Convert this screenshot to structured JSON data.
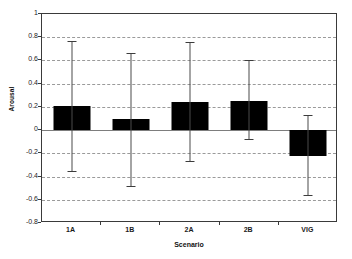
{
  "chart_data": {
    "type": "bar",
    "title": "",
    "subtitle": "",
    "xlabel": "Scenario",
    "ylabel": "Arousal",
    "categories": [
      "1A",
      "1B",
      "2A",
      "2B",
      "VIG"
    ],
    "values": [
      0.21,
      0.1,
      0.245,
      0.255,
      -0.22
    ],
    "error_low": [
      -0.35,
      -0.48,
      -0.27,
      -0.08,
      -0.56
    ],
    "error_high": [
      0.77,
      0.66,
      0.76,
      0.6,
      0.13
    ],
    "ylim": [
      -0.8,
      1.0
    ],
    "ytick_labels": [
      "1",
      "0.8",
      "0.6",
      "0.4",
      "0.2",
      "0",
      "-0.2",
      "-0.4",
      "-0.6",
      "-0.8"
    ],
    "ytick_values": [
      1,
      0.8,
      0.6,
      0.4,
      0.2,
      0,
      -0.2,
      -0.4,
      -0.6,
      -0.8
    ],
    "grid": true,
    "grid_style": "dashed-horizontal",
    "legend": false,
    "legend_position": "none",
    "bar_color": "#000000",
    "errorbar_color": "#4a4a4a",
    "gridline_color": "#9a9a9a",
    "axis_color": "#3a3a3a",
    "background_color": "#ffffff"
  }
}
